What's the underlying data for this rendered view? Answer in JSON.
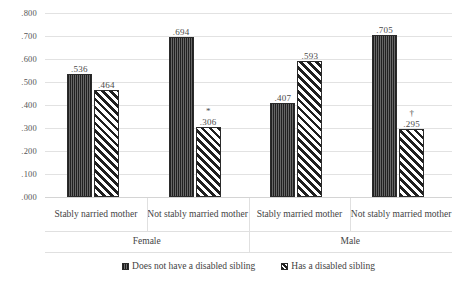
{
  "chart_data": {
    "type": "bar",
    "title": "",
    "subtitle": "",
    "xlabel": "",
    "ylabel": "",
    "ylim": [
      0.0,
      0.8
    ],
    "grid": true,
    "legend_position": "bottom",
    "y_ticks": [
      ".800",
      ".700",
      ".600",
      ".500",
      ".400",
      ".300",
      ".200",
      ".100",
      ".000"
    ],
    "y_tick_values": [
      0.8,
      0.7,
      0.6,
      0.5,
      0.4,
      0.3,
      0.2,
      0.1,
      0.0
    ],
    "groups": [
      {
        "label": "Female",
        "categories": [
          "Stably narried mother",
          "Not stably married mother"
        ]
      },
      {
        "label": "Male",
        "categories": [
          "Stably married mother",
          "Not stably married mother"
        ]
      }
    ],
    "categories": [
      "Stably narried mother",
      "Not stably married mother",
      "Stably married mother",
      "Not stably married mother"
    ],
    "series": [
      {
        "name": "Does not have a disabled sibling",
        "pattern": "solid-dark",
        "color": "#4a4a4a",
        "values": [
          0.536,
          0.694,
          0.407,
          0.705
        ],
        "labels": [
          ".536",
          ".694",
          ".407",
          ".705"
        ],
        "annotations": [
          "",
          "",
          "",
          ""
        ]
      },
      {
        "name": "Has a disabled sibling",
        "pattern": "diagonal-hatch",
        "color": "#ffffff",
        "values": [
          0.464,
          0.306,
          0.593,
          0.295
        ],
        "labels": [
          ".464",
          ".306",
          ".593",
          ".295"
        ],
        "annotations": [
          "",
          "*",
          "",
          "†"
        ]
      }
    ]
  },
  "legend": {
    "items": [
      {
        "label": "Does not have a disabled sibling",
        "swatch": "solid-dark-swatch"
      },
      {
        "label": "Has a disabled sibling",
        "swatch": "diagonal-hatch-swatch"
      }
    ]
  }
}
